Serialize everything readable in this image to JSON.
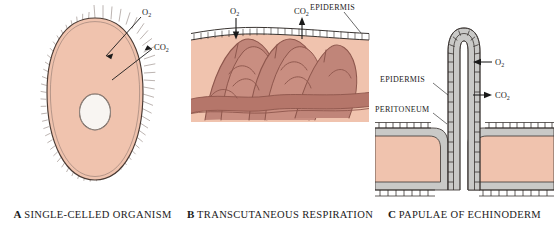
{
  "figure": {
    "colors": {
      "cytoplasm_pink": "#f0c3ae",
      "capillary_rose": "#b5766a",
      "peritoneum_gray": "#c9c9c7",
      "outline_dark": "#3a2f2b",
      "background": "#ffffff",
      "label_text": "#1a1a1a",
      "nucleus_fill": "#f7f4f1"
    }
  },
  "panels": [
    {
      "id": "a",
      "letter": "A",
      "caption": "SINGLE-CELLED ORGANISM",
      "labels": {
        "oxygen": "O",
        "oxygen_sub": "2",
        "carbon_dioxide": "CO",
        "carbon_dioxide_sub": "2"
      },
      "parts": [
        "cilia",
        "cell-membrane",
        "cytoplasm",
        "nucleus"
      ],
      "arrows": [
        {
          "gas": "O2",
          "direction": "inward"
        },
        {
          "gas": "CO2",
          "direction": "outward"
        }
      ]
    },
    {
      "id": "b",
      "letter": "B",
      "caption": "TRANSCUTANEOUS RESPIRATION",
      "labels": {
        "oxygen": "O",
        "oxygen_sub": "2",
        "carbon_dioxide": "CO",
        "carbon_dioxide_sub": "2",
        "epidermis": "EPIDERMIS"
      },
      "parts": [
        "epidermis",
        "capillary-network",
        "dermis"
      ],
      "arrows": [
        {
          "gas": "O2",
          "direction": "inward"
        },
        {
          "gas": "CO2",
          "direction": "outward"
        }
      ]
    },
    {
      "id": "c",
      "letter": "C",
      "caption": "PAPULAE OF ECHINODERM",
      "labels": {
        "oxygen": "O",
        "oxygen_sub": "2",
        "carbon_dioxide": "CO",
        "carbon_dioxide_sub": "2",
        "epidermis": "EPIDERMIS",
        "peritoneum": "PERITONEUM"
      },
      "parts": [
        "papula",
        "epidermis",
        "peritoneum",
        "coelomic-fluid"
      ],
      "arrows": [
        {
          "gas": "O2",
          "direction": "inward"
        },
        {
          "gas": "CO2",
          "direction": "outward"
        }
      ]
    }
  ]
}
